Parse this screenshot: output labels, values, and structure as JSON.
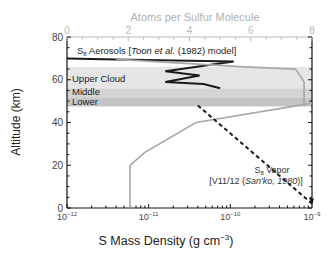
{
  "chart_data": {
    "type": "line",
    "title": "",
    "top_axis_label": "Atoms per Sulfur Molecule",
    "top_ticks": [
      "0",
      "2",
      "4",
      "6",
      "8"
    ],
    "xlabel": "S Mass Density (g cm⁻³)",
    "xlabel_main": "S Mass Density (g cm",
    "xlabel_sup": "−3",
    "xlabel_end": ")",
    "ylabel": "Altitude (km)",
    "xscale": "log",
    "xlim": [
      1e-12,
      1e-09
    ],
    "ylim": [
      0,
      80
    ],
    "x_ticks": [
      "10⁻¹²",
      "10⁻¹¹",
      "10⁻¹⁰",
      "10⁻⁹"
    ],
    "x_tick_base": "10",
    "x_tick_exps": [
      "−12",
      "−11",
      "−10",
      "−9"
    ],
    "y_ticks": [
      "0",
      "20",
      "40",
      "60",
      "80"
    ],
    "cloud_layers": [
      {
        "name": "Upper Cloud",
        "bottom": 56,
        "top": 66,
        "color": "#e6e6e6"
      },
      {
        "name": "Middle",
        "bottom": 51.5,
        "top": 56,
        "color": "#d4d4d4"
      },
      {
        "name": "Lower",
        "bottom": 47.5,
        "top": 51.5,
        "color": "#c4c4c4"
      }
    ],
    "series": [
      {
        "name": "S8 Aerosols [Toon et al. (1982) model]",
        "style": "solid",
        "color": "#1a1a1a",
        "axis": "bottom",
        "x": [
          1e-12,
          4e-12,
          1.1e-10,
          1.6e-11,
          4.2e-11,
          1.6e-11,
          4.7e-11,
          7.5e-11
        ],
        "y": [
          70,
          69.5,
          68.5,
          64,
          62,
          59,
          58,
          56
        ]
      },
      {
        "name": "Atoms per Sulfur Molecule profile",
        "style": "solid",
        "color": "#a8a8a8",
        "axis": "top",
        "x": [
          5.9e-12,
          5.9e-12,
          9e-12,
          3.8e-11,
          6.9e-10,
          1e-09
        ],
        "y": [
          0,
          20,
          26,
          40,
          48,
          49
        ]
      },
      {
        "name": "Atoms per Sulfur Molecule profile (upper)",
        "style": "solid",
        "color": "#a8a8a8",
        "axis": "top",
        "x": [
          4e-12,
          1.5e-10,
          6.3e-10,
          8e-10,
          8e-10
        ],
        "y": [
          69.5,
          66,
          65,
          59,
          48
        ]
      },
      {
        "name": "S8 Vapor [V11/12 (San'ko, 1980)]",
        "style": "dashed",
        "color": "#1a1a1a",
        "axis": "bottom",
        "x": [
          4e-11,
          1e-09
        ],
        "y": [
          48,
          2
        ]
      }
    ],
    "annotations": [
      {
        "text": "Upper Cloud"
      },
      {
        "text": "Middle"
      },
      {
        "text": "Lower"
      },
      {
        "text": "S8 Aerosols [Toon et al. (1982) model]"
      },
      {
        "text": "S8 Vapor"
      },
      {
        "text": "[V11/12 (San'ko, 1980)]"
      }
    ]
  },
  "labels": {
    "top_axis": "Atoms per Sulfur Molecule",
    "ylabel": "Altitude (km)",
    "upper": "Upper Cloud",
    "middle": "Middle",
    "lower": "Lower",
    "aer_s": "S",
    "aer_sub": "8",
    "aer_text": " Aerosols [",
    "aer_italic": "Toon et al.",
    "aer_end": " (1982) model]",
    "vap_s": "S",
    "vap_sub": "8",
    "vap_text": " Vapor",
    "vap2_a": "[V11/12 (",
    "vap2_italic": "San'ko, 1980",
    "vap2_b": ")]"
  }
}
